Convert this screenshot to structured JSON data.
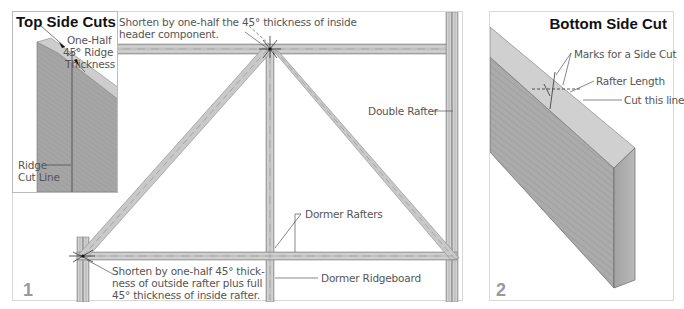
{
  "figure1": {
    "number": "1",
    "annotations": {
      "top_shorten_line1": "Shorten by one-half the 45° thickness of inside",
      "top_shorten_line2": "header component.",
      "double_rafter": "Double Rafter",
      "dormer_rafters": "Dormer Rafters",
      "bottom_shorten_line1": "Shorten by one-half 45° thick-",
      "bottom_shorten_line2": "ness of outside rafter plus full",
      "bottom_shorten_line3": "45° thickness of inside rafter.",
      "dormer_ridgeboard": "Dormer Ridgeboard"
    },
    "inset": {
      "title": "Top Side Cuts",
      "label_line1": "One-Half",
      "label_line2": "45° Ridge",
      "label_line3": "Thickness",
      "ridge_line1": "Ridge",
      "ridge_line2": "Cut Line"
    }
  },
  "figure2": {
    "number": "2",
    "title": "Bottom Side Cut",
    "annotations": {
      "marks": "Marks for a Side Cut",
      "rafter_length": "Rafter Length",
      "cut_line": "Cut this line"
    }
  },
  "colors": {
    "lumber_face": "#a9a9a9",
    "lumber_top": "#cfcfcf",
    "lumber_edge": "#bdbdbd",
    "frame_member": "#c8c8c8",
    "line": "#555555"
  }
}
